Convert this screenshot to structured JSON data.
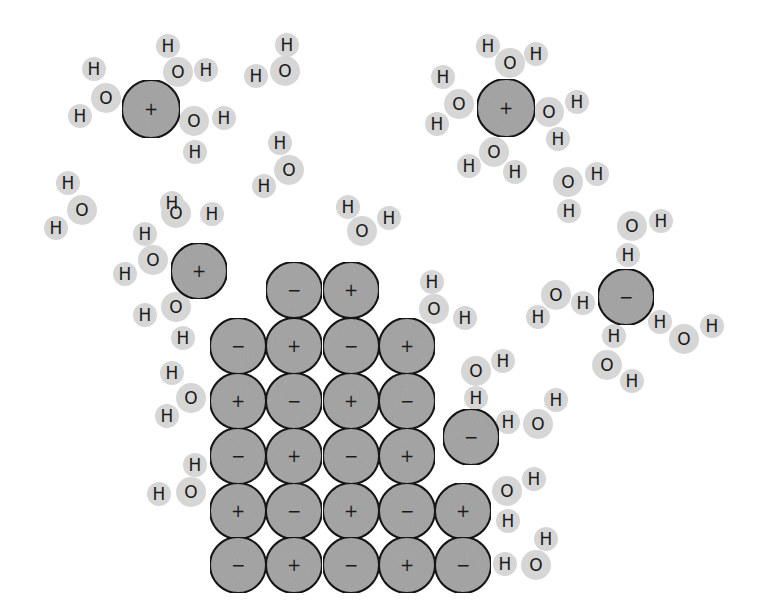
{
  "diagram": {
    "colors": {
      "background": "#ffffff",
      "ion_fill": "#a8a8a8",
      "ion_stroke": "#1a1a1a",
      "water_atom_fill": "#d6d6d6",
      "text": "#1a1a1a"
    },
    "ion_radius": 28,
    "oxygen_radius": 15,
    "hydrogen_radius": 12,
    "labels": {
      "oxygen": "O",
      "hydrogen": "H",
      "cation": "+",
      "anion": "−"
    },
    "lattice": {
      "rows": [
        {
          "y": 290,
          "ions": [
            {
              "x": 294,
              "charge": "−"
            },
            {
              "x": 351,
              "charge": "+"
            }
          ]
        },
        {
          "y": 346,
          "ions": [
            {
              "x": 238,
              "charge": "−"
            },
            {
              "x": 294,
              "charge": "+"
            },
            {
              "x": 351,
              "charge": "−"
            },
            {
              "x": 407,
              "charge": "+"
            }
          ]
        },
        {
          "y": 401,
          "ions": [
            {
              "x": 238,
              "charge": "+"
            },
            {
              "x": 294,
              "charge": "−"
            },
            {
              "x": 351,
              "charge": "+"
            },
            {
              "x": 407,
              "charge": "−"
            }
          ]
        },
        {
          "y": 456,
          "ions": [
            {
              "x": 238,
              "charge": "−"
            },
            {
              "x": 294,
              "charge": "+"
            },
            {
              "x": 351,
              "charge": "−"
            },
            {
              "x": 407,
              "charge": "+"
            }
          ]
        },
        {
          "y": 511,
          "ions": [
            {
              "x": 238,
              "charge": "+"
            },
            {
              "x": 294,
              "charge": "−"
            },
            {
              "x": 351,
              "charge": "+"
            },
            {
              "x": 407,
              "charge": "−"
            },
            {
              "x": 463,
              "charge": "+"
            }
          ]
        },
        {
          "y": 565,
          "ions": [
            {
              "x": 238,
              "charge": "−"
            },
            {
              "x": 294,
              "charge": "+"
            },
            {
              "x": 351,
              "charge": "−"
            },
            {
              "x": 407,
              "charge": "+"
            },
            {
              "x": 463,
              "charge": "−"
            }
          ]
        }
      ]
    },
    "free_ions": [
      {
        "x": 151,
        "y": 109,
        "charge": "+",
        "r": 29
      },
      {
        "x": 506,
        "y": 108,
        "charge": "+",
        "r": 29
      },
      {
        "x": 199,
        "y": 271,
        "charge": "+",
        "r": 28
      },
      {
        "x": 626,
        "y": 297,
        "charge": "−",
        "r": 28
      },
      {
        "x": 471,
        "y": 437,
        "charge": "−",
        "r": 28
      }
    ],
    "water_molecules": [
      {
        "O": [
          106,
          98
        ],
        "H": [
          [
            94,
            69
          ],
          [
            80,
            116
          ]
        ]
      },
      {
        "O": [
          178,
          72
        ],
        "H": [
          [
            168,
            46
          ],
          [
            206,
            70
          ]
        ]
      },
      {
        "O": [
          194,
          121
        ],
        "H": [
          [
            224,
            118
          ],
          [
            195,
            152
          ]
        ]
      },
      {
        "O": [
          285,
          71
        ],
        "H": [
          [
            287,
            45
          ],
          [
            256,
            76
          ]
        ]
      },
      {
        "O": [
          289,
          170
        ],
        "H": [
          [
            280,
            143
          ],
          [
            264,
            186
          ]
        ]
      },
      {
        "O": [
          82,
          210
        ],
        "H": [
          [
            68,
            183
          ],
          [
            56,
            228
          ]
        ]
      },
      {
        "O": [
          362,
          231
        ],
        "H": [
          [
            348,
            207
          ],
          [
            389,
            218
          ]
        ]
      },
      {
        "O": [
          510,
          63
        ],
        "H": [
          [
            488,
            46
          ],
          [
            536,
            54
          ]
        ]
      },
      {
        "O": [
          459,
          104
        ],
        "H": [
          [
            443,
            77
          ],
          [
            437,
            124
          ]
        ]
      },
      {
        "O": [
          549,
          112
        ],
        "H": [
          [
            577,
            102
          ],
          [
            558,
            139
          ]
        ]
      },
      {
        "O": [
          494,
          152
        ],
        "H": [
          [
            469,
            166
          ],
          [
            515,
            172
          ]
        ]
      },
      {
        "O": [
          568,
          182
        ],
        "H": [
          [
            597,
            174
          ],
          [
            569,
            211
          ]
        ]
      },
      {
        "O": [
          632,
          226
        ],
        "H": [
          [
            661,
            221
          ],
          [
            628,
            255
          ]
        ]
      },
      {
        "O": [
          556,
          295
        ],
        "H": [
          [
            583,
            303
          ],
          [
            538,
            317
          ]
        ]
      },
      {
        "O": [
          684,
          339
        ],
        "H": [
          [
            660,
            322
          ],
          [
            712,
            326
          ]
        ]
      },
      {
        "O": [
          607,
          365
        ],
        "H": [
          [
            614,
            336
          ],
          [
            632,
            381
          ]
        ]
      },
      {
        "O": [
          176,
          213
        ],
        "H": [
          [
            172,
            203
          ],
          [
            212,
            214
          ]
        ]
      },
      {
        "O": [
          153,
          260
        ],
        "H": [
          [
            145,
            234
          ],
          [
            125,
            274
          ]
        ]
      },
      {
        "O": [
          176,
          307
        ],
        "H": [
          [
            145,
            315
          ],
          [
            183,
            338
          ]
        ]
      },
      {
        "O": [
          434,
          309
        ],
        "H": [
          [
            432,
            282
          ],
          [
            465,
            318
          ]
        ]
      },
      {
        "O": [
          191,
          398
        ],
        "H": [
          [
            172,
            373
          ],
          [
            167,
            416
          ]
        ]
      },
      {
        "O": [
          476,
          371
        ],
        "H": [
          [
            503,
            361
          ],
          [
            476,
            398
          ]
        ]
      },
      {
        "O": [
          538,
          424
        ],
        "H": [
          [
            508,
            422
          ],
          [
            556,
            400
          ]
        ]
      },
      {
        "O": [
          191,
          492
        ],
        "H": [
          [
            195,
            465
          ],
          [
            159,
            494
          ]
        ]
      },
      {
        "O": [
          507,
          491
        ],
        "H": [
          [
            534,
            479
          ],
          [
            508,
            521
          ]
        ]
      },
      {
        "O": [
          536,
          565
        ],
        "H": [
          [
            505,
            564
          ],
          [
            546,
            539
          ]
        ]
      }
    ]
  }
}
